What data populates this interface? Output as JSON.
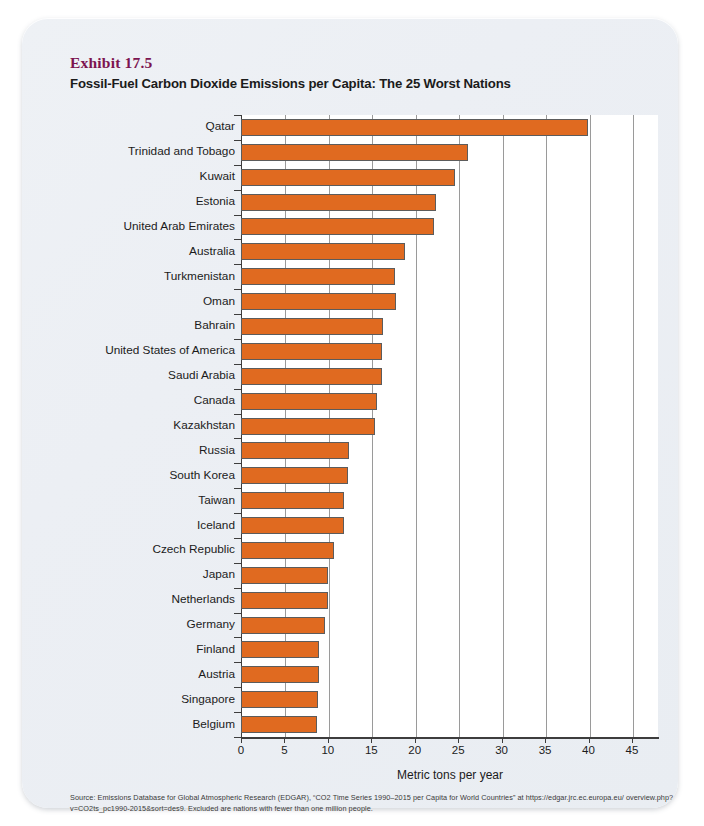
{
  "exhibit": {
    "number": "Exhibit 17.5",
    "title": "Fossil-Fuel Carbon Dioxide Emissions per Capita: The 25 Worst Nations",
    "number_color": "#7c1450",
    "bar_color": "#E06A20"
  },
  "source": {
    "line1": "Source: Emissions Database for Global Atmospheric Research (EDGAR), “CO2 Time Series 1990–2015 per Capita for World Countries” at https://edgar.jrc.ec.europa.eu/",
    "line2": "overview.php?v=CO2ts_pc1990-2015&sort=des9. Excluded are nations with fewer than one million people."
  },
  "chart_data": {
    "type": "bar",
    "orientation": "horizontal",
    "title": "Fossil-Fuel Carbon Dioxide Emissions per Capita: The 25 Worst Nations",
    "xlabel": "Metric tons per year",
    "ylabel": "",
    "xlim": [
      0,
      48
    ],
    "xticks": [
      0,
      5,
      10,
      15,
      20,
      25,
      30,
      35,
      40,
      45
    ],
    "xticklabels": [
      "0",
      "5",
      "10",
      "15",
      "20",
      "25",
      "30",
      "35",
      "40",
      "45"
    ],
    "grid": "vertical",
    "legend": "none",
    "categories": [
      "Qatar",
      "Trinidad and Tobago",
      "Kuwait",
      "Estonia",
      "United Arab Emirates",
      "Australia",
      "Turkmenistan",
      "Oman",
      "Bahrain",
      "United States of America",
      "Saudi Arabia",
      "Canada",
      "Kazakhstan",
      "Russia",
      "South Korea",
      "Taiwan",
      "Iceland",
      "Czech Republic",
      "Japan",
      "Netherlands",
      "Germany",
      "Finland",
      "Austria",
      "Singapore",
      "Belgium"
    ],
    "values": [
      39.9,
      26.1,
      24.6,
      22.5,
      22.2,
      18.9,
      17.7,
      17.8,
      16.4,
      16.2,
      16.2,
      15.7,
      15.4,
      12.4,
      12.3,
      11.9,
      11.8,
      10.7,
      10.0,
      10.0,
      9.7,
      9.0,
      9.0,
      8.9,
      8.8
    ]
  }
}
